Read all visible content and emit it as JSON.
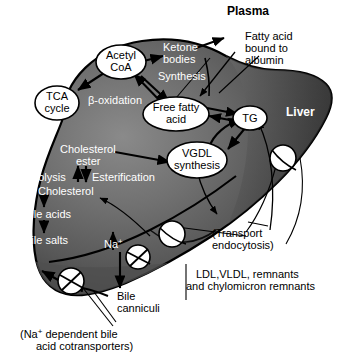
{
  "diagram": {
    "title_plasma": "Plasma",
    "label_liver": "Liver",
    "nodes": [
      {
        "id": "acetyl_coa",
        "line1": "Acetyl",
        "line2": "CoA"
      },
      {
        "id": "tca_cycle",
        "line1": "TCA",
        "line2": "cycle"
      },
      {
        "id": "free_fatty_acid",
        "line1": "Free fatty",
        "line2": "acid"
      },
      {
        "id": "tg",
        "line1": "TG",
        "line2": ""
      },
      {
        "id": "vgdl_synthesis",
        "line1": "VGDL",
        "line2": "synthesis"
      }
    ],
    "labels": {
      "ketone_bodies_1": "Ketone",
      "ketone_bodies_2": "bodies",
      "ketone_synthesis": "Synthesis",
      "beta_oxidation": "β-oxidation",
      "fatty_acid_albumin_1": "Fatty acid",
      "fatty_acid_albumin_2": "bound to",
      "fatty_acid_albumin_3": "albumin",
      "cholesterol_ester_1": "Cholesterol",
      "cholesterol_ester_2": "ester",
      "hydrolysis": "Hydrolysis",
      "esterification": "Esterification",
      "cholesterol": "Cholesterol",
      "bile_acids": "Bile acids",
      "bile_salts": "Bile salts",
      "sodium_upper": "Na",
      "sodium_upper_sup": "+",
      "sodium_lower": "Na",
      "sodium_lower_sup": "+",
      "bile_canniculi_1": "Bile",
      "bile_canniculi_2": "canniculi",
      "transport_endocytosis_1": "(Transport",
      "transport_endocytosis_2": "endocytosis)",
      "ldl_vldl_1": "LDL,VLDL, remnants",
      "ldl_vldl_2": "and chylomicron remnants",
      "cotransporters_1": "(Na",
      "cotransporters_1_sup": "+",
      "cotransporters_1_rest": " dependent bile",
      "cotransporters_2": "acid cotransporters)"
    },
    "colors": {
      "liver_light": "#8e8e8e",
      "liver_mid": "#6b6b6b",
      "liver_dark": "#3a3a3a",
      "liver_darkest": "#2b2b2b",
      "outline": "#000000",
      "node_fill": "#ffffff",
      "text_on_dark": "#ffffff",
      "text_on_light": "#000000",
      "background": "#ffffff"
    }
  }
}
